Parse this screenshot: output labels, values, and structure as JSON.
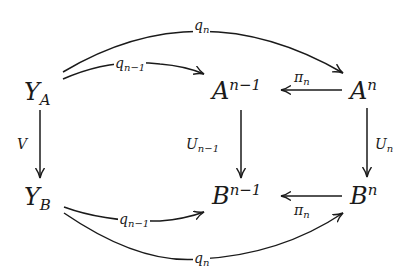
{
  "diagram": {
    "type": "commutative-diagram",
    "stroke_color": "#1a1a1a",
    "background": "#ffffff",
    "nodes": {
      "ya": {
        "base": "Y",
        "sub": "A",
        "sup": ""
      },
      "an1": {
        "base": "A",
        "sub": "",
        "sup": "n−1"
      },
      "an": {
        "base": "A",
        "sub": "",
        "sup": "n"
      },
      "yb": {
        "base": "Y",
        "sub": "B",
        "sup": ""
      },
      "bn1": {
        "base": "B",
        "sub": "",
        "sup": "n−1"
      },
      "bn": {
        "base": "B",
        "sub": "",
        "sup": "n"
      }
    },
    "arrows": {
      "top_outer": {
        "from": "Y_A",
        "to": "A^n",
        "base": "q",
        "sub": "n"
      },
      "top_inner": {
        "from": "Y_A",
        "to": "A^{n-1}",
        "base": "q",
        "sub": "n−1"
      },
      "pi_top": {
        "from": "A^n",
        "to": "A^{n-1}",
        "base": "π",
        "sub": "n"
      },
      "v": {
        "from": "Y_A",
        "to": "Y_B",
        "base": "V",
        "sub": ""
      },
      "u_n1": {
        "from": "A^{n-1}",
        "to": "B^{n-1}",
        "base": "U",
        "sub": "n−1"
      },
      "u_n": {
        "from": "A^n",
        "to": "B^n",
        "base": "U",
        "sub": "n"
      },
      "bottom_inner": {
        "from": "Y_B",
        "to": "B^{n-1}",
        "base": "q",
        "sub": "n−1"
      },
      "pi_bottom": {
        "from": "B^n",
        "to": "B^{n-1}",
        "base": "π",
        "sub": "n"
      },
      "bottom_outer": {
        "from": "Y_B",
        "to": "B^n",
        "base": "q",
        "sub": "n"
      }
    }
  }
}
